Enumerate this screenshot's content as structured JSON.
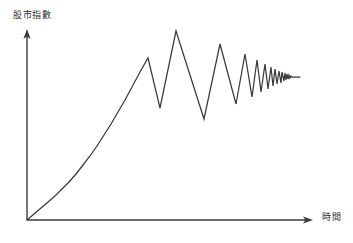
{
  "figure": {
    "background_color": "#ffffff",
    "stroke_color": "#3a3a3a",
    "axis_color": "#3a3a3a"
  },
  "axes": {
    "y": {
      "label": "股市指數",
      "origin": [
        27,
        220
      ],
      "tip": [
        27,
        30
      ]
    },
    "x": {
      "label": "時間",
      "origin": [
        27,
        220
      ],
      "tip": [
        313,
        220
      ]
    }
  },
  "chart_data": {
    "type": "line",
    "title": "",
    "xlabel": "時間",
    "ylabel": "股市指數",
    "grid": false,
    "legend": null,
    "xlim": [
      0,
      100
    ],
    "ylim": [
      0,
      100
    ],
    "series": [
      {
        "name": "股市指數",
        "color": "#3a3a3a",
        "points_px": [
          [
            27,
            220
          ],
          [
            34,
            214
          ],
          [
            41,
            208
          ],
          [
            48,
            202
          ],
          [
            55,
            196
          ],
          [
            62,
            189
          ],
          [
            69,
            182
          ],
          [
            76,
            174
          ],
          [
            83,
            165
          ],
          [
            90,
            156
          ],
          [
            97,
            146
          ],
          [
            104,
            135
          ],
          [
            111,
            124
          ],
          [
            118,
            112
          ],
          [
            125,
            100
          ],
          [
            132,
            87
          ],
          [
            140,
            72
          ],
          [
            148,
            58
          ],
          [
            160,
            108
          ],
          [
            176,
            31
          ],
          [
            204,
            119
          ],
          [
            220,
            44
          ],
          [
            236,
            104
          ],
          [
            245,
            54
          ],
          [
            252,
            97
          ],
          [
            257,
            60
          ],
          [
            261,
            92
          ],
          [
            265,
            64
          ],
          [
            268,
            89
          ],
          [
            271,
            67
          ],
          [
            273,
            86
          ],
          [
            275,
            69
          ],
          [
            277,
            84
          ],
          [
            279,
            71
          ],
          [
            281,
            83
          ],
          [
            282,
            72
          ],
          [
            284,
            81
          ],
          [
            285,
            73
          ],
          [
            286,
            80
          ],
          [
            287,
            74
          ],
          [
            288,
            79
          ],
          [
            289,
            75
          ],
          [
            290,
            78
          ],
          [
            291,
            76
          ],
          [
            292,
            77
          ],
          [
            300,
            77
          ]
        ]
      }
    ]
  }
}
